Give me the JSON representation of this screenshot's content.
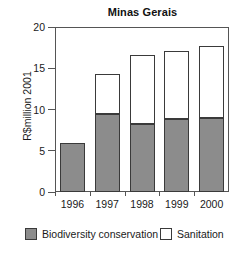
{
  "chart_data": {
    "type": "bar",
    "subtype": "stacked-vertical",
    "title": "Minas Gerais",
    "xlabel": "",
    "ylabel": "R$million 2001",
    "categories": [
      "1996",
      "1997",
      "1998",
      "1999",
      "2000"
    ],
    "series": [
      {
        "name": "Biodiversity conservation",
        "color": "#8c8c8c",
        "values": [
          6.0,
          9.4,
          8.2,
          8.8,
          9.0
        ]
      },
      {
        "name": "Sanitation",
        "color": "#ffffff",
        "values": [
          0.0,
          4.9,
          8.4,
          8.3,
          8.7
        ]
      }
    ],
    "totals": [
      6.0,
      14.3,
      16.6,
      17.1,
      17.7
    ],
    "ylim": [
      0,
      20
    ],
    "yticks": [
      0,
      5,
      10,
      15,
      20
    ],
    "ytick_labels": [
      "0",
      "5",
      "10",
      "15",
      "20"
    ],
    "grid": false,
    "legend_position": "bottom",
    "legend": [
      {
        "label": "Biodiversity conservation",
        "color": "#8c8c8c"
      },
      {
        "label": "Sanitation",
        "color": "#ffffff"
      }
    ]
  },
  "colors": {
    "biodiversity": "#8c8c8c",
    "sanitation": "#ffffff",
    "axis": "#555555",
    "outline": "#3a3a3a",
    "text": "#1a1a1a",
    "background": "#ffffff"
  }
}
